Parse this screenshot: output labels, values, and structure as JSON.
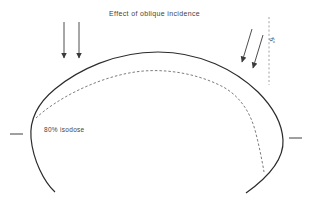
{
  "title": "Effect of oblique incidence",
  "diagram": {
    "isodose_label": "80% isodose",
    "angle_label": "5°"
  },
  "icons": {
    "normal_beam_arrows": "down-arrow-icon",
    "oblique_beam_arrows": "diagonal-down-left-arrow-icon"
  },
  "colors": {
    "background": "#ffffff",
    "contour": "#2b2b2b",
    "isodose_dash": "#5a5a5a",
    "arrow": "#3a3a3a",
    "reference_dash": "#8a8a8a",
    "text": "#3f3f3f"
  }
}
